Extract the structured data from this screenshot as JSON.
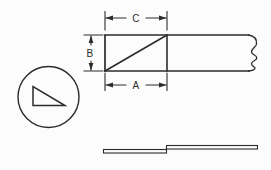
{
  "figure": {
    "labels": {
      "top_dimension": "C",
      "left_dimension": "B",
      "bottom_dimension": "A"
    },
    "colors": {
      "line": "#2b2b2b",
      "background": "#fcfcfc"
    }
  }
}
